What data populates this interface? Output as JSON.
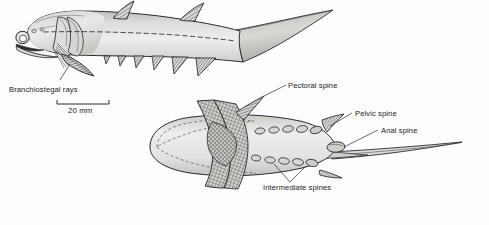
{
  "figure": {
    "background_color": "#fdfdfd",
    "ink_color": "#1a1a1a",
    "body_fill_light": "#e8e8e6",
    "body_fill_mid": "#c9c9c6",
    "body_fill_dark": "#9a9a97",
    "hatch_color": "#555553"
  },
  "labels": {
    "branchiostegal_rays": "Branchiostegal rays",
    "pectoral_spine": "Pectoral spine",
    "pelvic_spine": "Pelvic spine",
    "anal_spine": "Anal spine",
    "intermediate_spines": "Intermediate spines"
  },
  "scale_bar": {
    "value": "20 mm",
    "length_px": 52,
    "units": "mm",
    "magnitude": 20
  },
  "panels": [
    {
      "name": "lateral-view",
      "view": "lateral",
      "features": [
        "eye",
        "mouth",
        "opercular-gill-cover",
        "branchiostegal-rays",
        "lateral-line",
        "first-dorsal-spine",
        "second-dorsal-spine",
        "pectoral-spine",
        "intermediate-spines",
        "pelvic-spine",
        "anal-spine",
        "caudal-fin"
      ],
      "dorsal_spine_count": 2,
      "ventral_spine_count": 6
    },
    {
      "name": "ventral-view",
      "view": "ventral",
      "features": [
        "pectoral-fins",
        "pectoral-spine",
        "intermediate-spines",
        "pelvic-spine",
        "anal-spine",
        "caudal-fin"
      ],
      "intermediate_spine_pairs": 5
    }
  ]
}
